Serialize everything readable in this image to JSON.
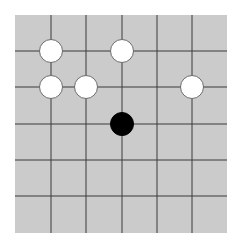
{
  "board": {
    "columns": 6,
    "rows": 6,
    "background_color": "#cbcbcb",
    "line_color": "#3a3a3a",
    "vertical_lines_x": [
      36,
      71,
      107,
      142,
      177
    ],
    "horizontal_lines_y": [
      36,
      72,
      109,
      145,
      181
    ],
    "width": 212,
    "height": 218
  },
  "stones": [
    {
      "color": "white",
      "col": 1,
      "row": 1
    },
    {
      "color": "white",
      "col": 3,
      "row": 1
    },
    {
      "color": "white",
      "col": 1,
      "row": 2
    },
    {
      "color": "white",
      "col": 2,
      "row": 2
    },
    {
      "color": "white",
      "col": 5,
      "row": 2
    },
    {
      "color": "black",
      "col": 3,
      "row": 3
    }
  ]
}
